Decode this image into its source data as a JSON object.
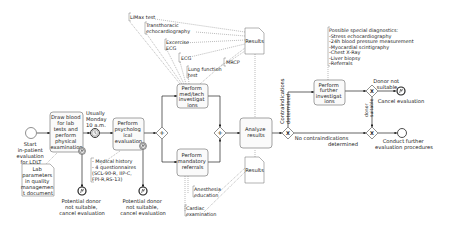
{
  "diagram": {
    "type": "BPMN process",
    "start_event": {
      "label_lines": [
        "Start",
        "in-patient",
        "evaluation",
        "for LDLT"
      ]
    },
    "tasks": {
      "draw_blood": {
        "lines": [
          "Draw blood",
          "for lab",
          "tests and",
          "perform",
          "physical",
          "examination"
        ]
      },
      "psych_eval": {
        "lines": [
          "Perform",
          "psycholog",
          "ical",
          "evaluation"
        ]
      },
      "med_tech": {
        "lines": [
          "Perform",
          "med/tech",
          "investigat",
          "ions"
        ]
      },
      "mandatory_referrals": {
        "lines": [
          "Perform",
          "mandatory",
          "referrals"
        ]
      },
      "analyze_results": {
        "lines": [
          "Analyze",
          "results"
        ]
      },
      "further_investigations": {
        "lines": [
          "Perform",
          "further",
          "investigat",
          "ions"
        ]
      }
    },
    "timer_event": {
      "label_lines": [
        "Usually",
        "Monday",
        "10 a.m."
      ]
    },
    "documents": {
      "lab_parameters": {
        "lines": [
          "Lab",
          "parameters",
          "in quality",
          "managemen",
          "t document"
        ]
      },
      "results_top": {
        "label": "Results"
      },
      "results_bottom": {
        "label": "Results"
      }
    },
    "annotations": {
      "psych": {
        "lines": [
          "- Medical history",
          "- 4 questionnaires",
          "(SCL-90-R, IIP-C,",
          "FPI-R,RS-13)"
        ]
      },
      "limax": {
        "lines": [
          "LiMax test"
        ]
      },
      "echo": {
        "lines": [
          "Transthoracic",
          "echocardiography"
        ]
      },
      "exercise_ecg": {
        "lines": [
          "Excercise",
          "ECG"
        ]
      },
      "ecg": {
        "lines": [
          "ECG"
        ]
      },
      "lung": {
        "lines": [
          "Lung function",
          "test"
        ]
      },
      "mrcp": {
        "lines": [
          "MRCP"
        ]
      },
      "anesthesia": {
        "lines": [
          "Anesthesia",
          "education"
        ]
      },
      "cardiac": {
        "lines": [
          "Cardiac",
          "examination"
        ]
      },
      "special_diagnostics": {
        "lines": [
          "Possible special diagnostics:",
          "-Stress echocardiography",
          "-24h blood pressure measurement",
          "-Myocardial scintigraphy",
          "-Chest X-Ray",
          "-Liver biopsy",
          "-Referrals"
        ]
      }
    },
    "end_events": {
      "cancel_1": {
        "lines": [
          "Potential donor",
          "not suitable,",
          "cancel evaluation"
        ]
      },
      "cancel_2": {
        "lines": [
          "Potential donor",
          "not suitable,",
          "cancel evaluation"
        ]
      },
      "cancel_3": {
        "lines": [
          "Cancel evaluation"
        ]
      },
      "conduct": {
        "lines": [
          "Conduct further",
          "evaluation procedures"
        ]
      }
    },
    "flow_labels": {
      "contraindications": {
        "lines": [
          "Contraindications",
          "determined"
        ]
      },
      "no_contraindications": {
        "lines": [
          "No contraindications",
          "determined"
        ]
      },
      "donor_not_suitable": {
        "lines": [
          "Donor not",
          "suitable"
        ]
      },
      "donor_suitable": {
        "lines": [
          "donor",
          "suitable"
        ]
      }
    },
    "gateways": {
      "parallel_symbol": "+",
      "exclusive_symbol": "X"
    },
    "colors": {
      "line": "#222222",
      "task_border": "#666666",
      "task_fill": "#fafafa",
      "background": "#ffffff"
    }
  }
}
